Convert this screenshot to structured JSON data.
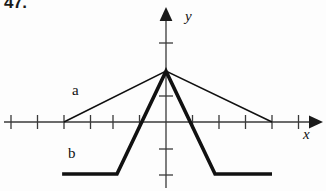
{
  "figure": {
    "problem_number": "47.",
    "axis_labels": {
      "x": "x",
      "y": "y"
    },
    "curve_labels": {
      "a": "a",
      "b": "b"
    }
  },
  "chart_data": {
    "type": "line",
    "title": "",
    "xlabel": "x",
    "ylabel": "y",
    "grid": false,
    "legend": "inline-annotations",
    "axes": {
      "origin_px": [
        166,
        122
      ],
      "unit_px": 26.5,
      "xlim": [
        -5.85,
        5.8
      ],
      "ylim": [
        -2.0,
        3.0
      ],
      "x_tick_values": [
        -5,
        -4,
        -3,
        -2,
        -1,
        1,
        2,
        3,
        4,
        5
      ],
      "y_tick_values": [
        -2,
        -1,
        1,
        2,
        3
      ],
      "x_arrow": true,
      "y_arrow": true
    },
    "series": [
      {
        "name": "a",
        "label": "a",
        "style": "thin",
        "stroke_width_px": 1.6,
        "color": "#111111",
        "points_units": [
          [
            -3.85,
            0.0
          ],
          [
            0.0,
            1.92
          ],
          [
            4.0,
            0.0
          ]
        ]
      },
      {
        "name": "b",
        "label": "b",
        "style": "thick",
        "stroke_width_px": 3.6,
        "color": "#111111",
        "points_units": [
          [
            -3.92,
            -1.96
          ],
          [
            -1.85,
            -1.96
          ],
          [
            0.0,
            1.92
          ],
          [
            1.85,
            -1.96
          ],
          [
            4.0,
            -1.96
          ]
        ]
      }
    ]
  }
}
